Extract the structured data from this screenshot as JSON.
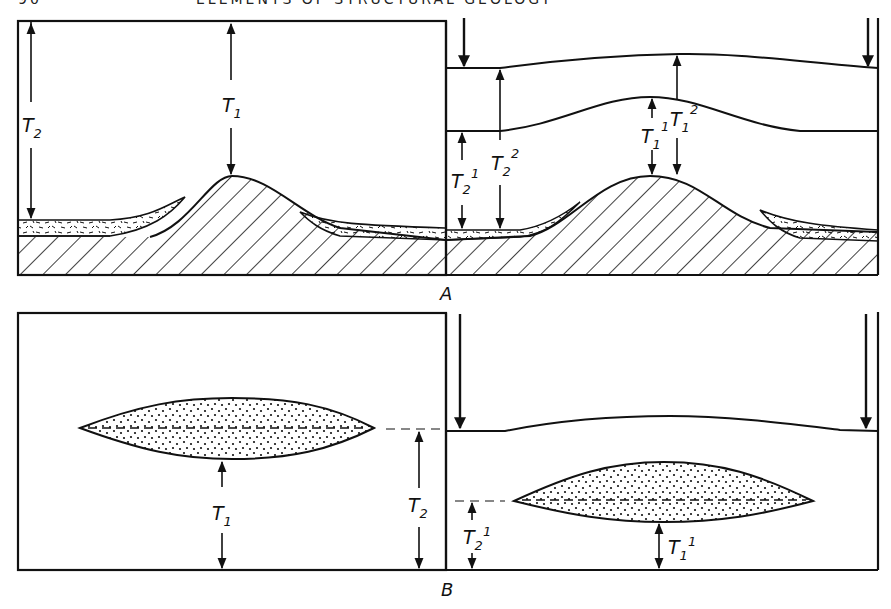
{
  "page": {
    "number": "90",
    "running_title": "ELEMENTS OF STRUCTURAL GEOLOGY"
  },
  "figure": {
    "panel_a": {
      "label": "A",
      "left_box": {
        "labels": {
          "t2": {
            "base": "T",
            "sub": "2"
          },
          "t1": {
            "base": "T",
            "sub": "1"
          }
        }
      },
      "right_box": {
        "labels": {
          "t2_1": {
            "base": "T",
            "sub": "2",
            "sup": "1"
          },
          "t2_2": {
            "base": "T",
            "sub": "2",
            "sup": "2"
          },
          "t1_1": {
            "base": "T",
            "sub": "1",
            "sup": "1"
          },
          "t1_2": {
            "base": "T",
            "sub": "1",
            "sup": "2"
          }
        }
      }
    },
    "panel_b": {
      "label": "B",
      "left_box": {
        "labels": {
          "t1": {
            "base": "T",
            "sub": "1"
          },
          "t2": {
            "base": "T",
            "sub": "2"
          }
        }
      },
      "right_box": {
        "labels": {
          "t2_1": {
            "base": "T",
            "sub": "2",
            "sup": "1"
          },
          "t1_1": {
            "base": "T",
            "sub": "1",
            "sup": "1"
          }
        }
      }
    },
    "colors": {
      "ink": "#111111",
      "paper": "#ffffff"
    }
  }
}
